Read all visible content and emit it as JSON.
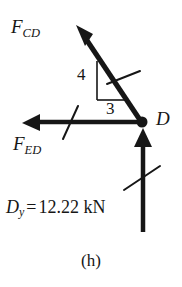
{
  "figure": {
    "caption": "(h)",
    "type": "free-body-diagram",
    "joint_label": "D",
    "stroke_color": "#161616",
    "background_color": "#ffffff"
  },
  "labels": {
    "force_cd": {
      "symbol": "F",
      "subscript": "CD",
      "full": "F_CD"
    },
    "force_ed": {
      "symbol": "F",
      "subscript": "ED",
      "full": "F_ED"
    },
    "joint": "D",
    "reaction": {
      "symbol": "D",
      "subscript": "y",
      "equals": "=",
      "value": "12.22",
      "unit": "kN",
      "full": "D_y = 12.22 kN"
    }
  },
  "slope_triangle": {
    "rise": "4",
    "run": "3",
    "ratio": "4:3"
  },
  "vectors": [
    {
      "name": "F_CD",
      "direction": "up-left",
      "tail": [
        142,
        122
      ],
      "tip": [
        78,
        26
      ],
      "slope_rise": 4,
      "slope_run": 3,
      "has_slash_tick": true
    },
    {
      "name": "F_ED",
      "direction": "left",
      "tail": [
        142,
        122
      ],
      "tip": [
        23,
        123
      ],
      "has_slash_tick": true
    },
    {
      "name": "D_y",
      "direction": "up",
      "tail": [
        143,
        232
      ],
      "tip": [
        143,
        130
      ],
      "magnitude": "12.22",
      "unit": "kN",
      "has_slash_tick": true
    }
  ],
  "node": {
    "name": "D",
    "x": 142,
    "y": 122,
    "radius": 5
  }
}
